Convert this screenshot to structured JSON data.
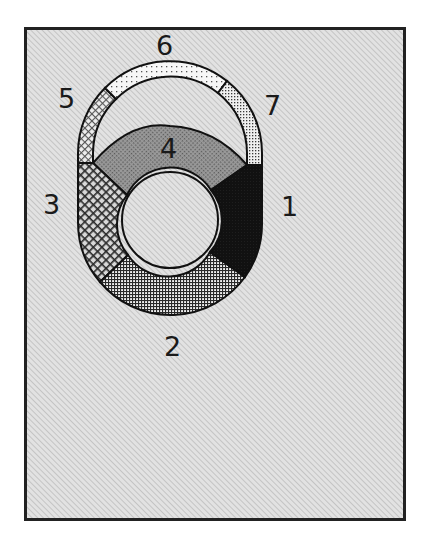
{
  "diagram": {
    "frame": {
      "background": "#d9d9d9",
      "border_color": "#222222"
    },
    "segments": [
      {
        "id": "1",
        "label": "1",
        "pattern": "solid-black",
        "color": "#111111"
      },
      {
        "id": "2",
        "label": "2",
        "pattern": "fine-grid",
        "color": "#555555"
      },
      {
        "id": "3",
        "label": "3",
        "pattern": "crosshatch-diamond",
        "color": "#666666"
      },
      {
        "id": "4",
        "label": "4",
        "pattern": "dense-gray-dots",
        "color": "#8a8a8a"
      },
      {
        "id": "5",
        "label": "5",
        "pattern": "light-crosshatch",
        "color": "#aaaaaa"
      },
      {
        "id": "6",
        "label": "6",
        "pattern": "sparse-dots",
        "color": "#eeeeee"
      },
      {
        "id": "7",
        "label": "7",
        "pattern": "medium-dots",
        "color": "#c8c8c8"
      }
    ],
    "labels": {
      "l1": "1",
      "l2": "2",
      "l3": "3",
      "l4": "4",
      "l5": "5",
      "l6": "6",
      "l7": "7"
    }
  }
}
